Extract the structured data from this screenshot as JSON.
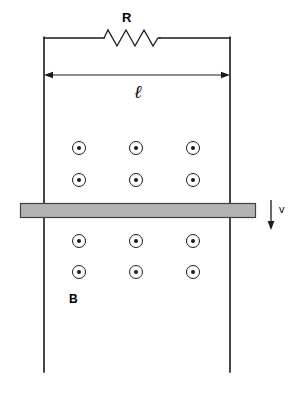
{
  "diagram": {
    "type": "physics-circuit-diagram",
    "colors": {
      "line": "#1a1a1a",
      "bar_fill": "#b3b3b3",
      "bar_stroke": "#404040",
      "background": "#ffffff",
      "text": "#000000"
    },
    "labels": {
      "resistor": "R",
      "length": "ℓ",
      "field": "B",
      "velocity": "v"
    },
    "components": {
      "resistor": {
        "name": "resistor",
        "label": "R",
        "zigzag_peaks": 6,
        "x_start": 104,
        "x_end": 160,
        "y": 38
      },
      "rails": {
        "name": "conducting-rails",
        "left_x": 44,
        "right_x": 230,
        "top_y": 38,
        "bottom_y": 372
      },
      "dimension": {
        "name": "length-dimension-arrow",
        "label": "ℓ",
        "y": 75,
        "x_start": 44,
        "x_end": 230
      },
      "bar": {
        "name": "sliding-conducting-bar",
        "x": 20,
        "y": 203,
        "width": 236,
        "height": 14
      },
      "velocity_arrow": {
        "name": "velocity-arrow",
        "label": "v",
        "direction": "down",
        "x": 271,
        "y_start": 200,
        "y_end": 229
      },
      "field_label": {
        "name": "magnetic-field-label",
        "label": "B",
        "x": 73,
        "y": 299
      }
    },
    "field_symbols": {
      "name": "magnetic-field-out-of-page-dots",
      "meaning": "field out of page",
      "circle_radius": 6.5,
      "dot_radius": 2,
      "columns_x": [
        79,
        136,
        193
      ],
      "rows_y": [
        148,
        180,
        241,
        272
      ],
      "count": 12
    }
  }
}
